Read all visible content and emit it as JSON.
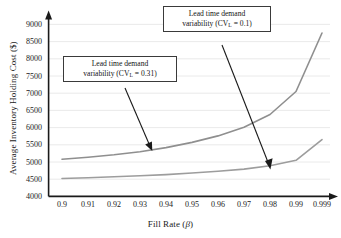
{
  "chart_data": {
    "type": "line",
    "title": "",
    "xlabel": "Fill Rate (β)",
    "ylabel": "Average Inventory Holding Cost ($)",
    "categories": [
      "0.9",
      "0.91",
      "0.92",
      "0.93",
      "0.94",
      "0.95",
      "0.96",
      "0.97",
      "0.98",
      "0.99",
      "0.999"
    ],
    "x_tick_labels": [
      "0.9",
      "0.91",
      "0.92",
      "0.93",
      "0.94",
      "0.95",
      "0.96",
      "0.97",
      "0.98",
      "0.99",
      "0.999"
    ],
    "y_tick_labels": [
      "9000",
      "8500",
      "8000",
      "7500",
      "7000",
      "6500",
      "6000",
      "5500",
      "5000",
      "4500",
      "4000"
    ],
    "y_ticks": [
      9000,
      8500,
      8000,
      7500,
      7000,
      6500,
      6000,
      5500,
      5000,
      4500,
      4000
    ],
    "ylim": [
      4000,
      9200
    ],
    "grid": "horizontal",
    "legend_position": "annotations",
    "series": [
      {
        "name": "Lead time demand variability (CV_L = 0.31)",
        "color": "#8f8f8f",
        "values": [
          5080,
          5140,
          5210,
          5300,
          5420,
          5570,
          5760,
          6010,
          6380,
          7050,
          8750
        ]
      },
      {
        "name": "Lead time demand variability (CV_L = 0.1)",
        "color": "#9d9d9d",
        "values": [
          4520,
          4545,
          4570,
          4600,
          4635,
          4680,
          4730,
          4795,
          4890,
          5050,
          5650
        ]
      }
    ],
    "annotations": [
      {
        "id": "cv01",
        "line1": "Lead time demand",
        "line2_pre": "variability (CV",
        "line2_sub": "L",
        "line2_post": " = 0.1)",
        "text": "Lead time demand variability (CV_L = 0.1)",
        "points_to_series": "Lead time demand variability (CV_L = 0.1)",
        "arrow_target_x": 0.984,
        "arrow_target_y": 4930
      },
      {
        "id": "cv031",
        "line1": "Lead time demand",
        "line2_pre": "variability (CV",
        "line2_sub": "L",
        "line2_post": " = 0.31)",
        "text": "Lead time demand variability (CV_L = 0.31)",
        "points_to_series": "Lead time demand variability (CV_L = 0.31)",
        "arrow_target_x": 0.9355,
        "arrow_target_y": 5480
      }
    ]
  },
  "axes": {
    "x_title": "Fill Rate (β)",
    "x_title_plain": "Fill Rate (",
    "x_title_symbol": "β",
    "x_title_close": ")",
    "y_title": "Average Inventory Holding Cost ($)"
  },
  "colors": {
    "axis": "#1a1a1a",
    "grid": "#e2e2e2",
    "series_high": "#8f8f8f",
    "series_low": "#9d9d9d",
    "callout_border": "#3a3a3a",
    "background": "#ffffff",
    "arrow": "#1a1a1a"
  }
}
